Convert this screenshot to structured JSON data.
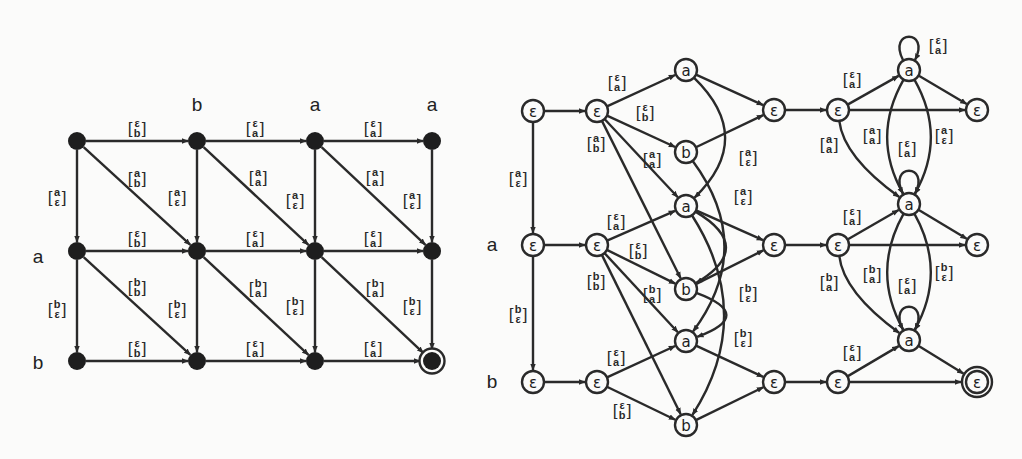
{
  "left_graph": {
    "column_labels": [
      {
        "text": "b",
        "x": 197,
        "y": 104
      },
      {
        "text": "a",
        "x": 315,
        "y": 104
      },
      {
        "text": "a",
        "x": 432,
        "y": 104
      }
    ],
    "row_labels": [
      {
        "text": "a",
        "x": 38,
        "y": 256
      },
      {
        "text": "b",
        "x": 38,
        "y": 362
      }
    ],
    "nodes": [
      {
        "id": "L00",
        "x": 77,
        "y": 141
      },
      {
        "id": "L01",
        "x": 197,
        "y": 141
      },
      {
        "id": "L02",
        "x": 315,
        "y": 141
      },
      {
        "id": "L03",
        "x": 432,
        "y": 141
      },
      {
        "id": "L10",
        "x": 77,
        "y": 251
      },
      {
        "id": "L11",
        "x": 197,
        "y": 251
      },
      {
        "id": "L12",
        "x": 315,
        "y": 251
      },
      {
        "id": "L13",
        "x": 432,
        "y": 251
      },
      {
        "id": "L20",
        "x": 77,
        "y": 361
      },
      {
        "id": "L21",
        "x": 197,
        "y": 361
      },
      {
        "id": "L22",
        "x": 315,
        "y": 361
      },
      {
        "id": "L23",
        "x": 432,
        "y": 361,
        "final": true
      }
    ],
    "edges": [
      {
        "from": "L00",
        "to": "L01",
        "top": "ε",
        "bottom": "b",
        "lx": 137,
        "ly": 128
      },
      {
        "from": "L01",
        "to": "L02",
        "top": "ε",
        "bottom": "a",
        "lx": 255,
        "ly": 128
      },
      {
        "from": "L02",
        "to": "L03",
        "top": "ε",
        "bottom": "a",
        "lx": 373,
        "ly": 128
      },
      {
        "from": "L10",
        "to": "L11",
        "top": "ε",
        "bottom": "b",
        "lx": 137,
        "ly": 238
      },
      {
        "from": "L11",
        "to": "L12",
        "top": "ε",
        "bottom": "a",
        "lx": 255,
        "ly": 238
      },
      {
        "from": "L12",
        "to": "L13",
        "top": "ε",
        "bottom": "a",
        "lx": 373,
        "ly": 238
      },
      {
        "from": "L20",
        "to": "L21",
        "top": "ε",
        "bottom": "b",
        "lx": 137,
        "ly": 348
      },
      {
        "from": "L21",
        "to": "L22",
        "top": "ε",
        "bottom": "a",
        "lx": 255,
        "ly": 348
      },
      {
        "from": "L22",
        "to": "L23",
        "top": "ε",
        "bottom": "a",
        "lx": 373,
        "ly": 348
      },
      {
        "from": "L00",
        "to": "L10",
        "top": "a",
        "bottom": "ε",
        "lx": 57,
        "ly": 197
      },
      {
        "from": "L01",
        "to": "L11",
        "top": "a",
        "bottom": "ε",
        "lx": 177,
        "ly": 197
      },
      {
        "from": "L02",
        "to": "L12",
        "top": "a",
        "bottom": "ε",
        "lx": 295,
        "ly": 200
      },
      {
        "from": "L03",
        "to": "L13",
        "top": "a",
        "bottom": "ε",
        "lx": 412,
        "ly": 200
      },
      {
        "from": "L10",
        "to": "L20",
        "top": "b",
        "bottom": "ε",
        "lx": 57,
        "ly": 309
      },
      {
        "from": "L11",
        "to": "L21",
        "top": "b",
        "bottom": "ε",
        "lx": 177,
        "ly": 309
      },
      {
        "from": "L12",
        "to": "L22",
        "top": "b",
        "bottom": "ε",
        "lx": 295,
        "ly": 306
      },
      {
        "from": "L13",
        "to": "L23",
        "top": "b",
        "bottom": "ε",
        "lx": 412,
        "ly": 306
      },
      {
        "from": "L00",
        "to": "L11",
        "top": "a",
        "bottom": "b",
        "lx": 137,
        "ly": 178
      },
      {
        "from": "L01",
        "to": "L12",
        "top": "a",
        "bottom": "a",
        "lx": 258,
        "ly": 177
      },
      {
        "from": "L02",
        "to": "L13",
        "top": "a",
        "bottom": "a",
        "lx": 375,
        "ly": 177
      },
      {
        "from": "L10",
        "to": "L21",
        "top": "b",
        "bottom": "b",
        "lx": 137,
        "ly": 287
      },
      {
        "from": "L11",
        "to": "L22",
        "top": "b",
        "bottom": "a",
        "lx": 258,
        "ly": 288
      },
      {
        "from": "L12",
        "to": "L23",
        "top": "b",
        "bottom": "a",
        "lx": 375,
        "ly": 288
      }
    ]
  },
  "right_graph": {
    "row_labels": [
      {
        "text": "a",
        "x": 492,
        "y": 244
      },
      {
        "text": "b",
        "x": 492,
        "y": 381
      }
    ],
    "nodes": [
      {
        "id": "R0",
        "x": 533,
        "y": 111,
        "sym": "ε"
      },
      {
        "id": "R1",
        "x": 597,
        "y": 111,
        "sym": "ε"
      },
      {
        "id": "R2",
        "x": 533,
        "y": 245,
        "sym": "ε"
      },
      {
        "id": "R3",
        "x": 597,
        "y": 245,
        "sym": "ε"
      },
      {
        "id": "R4",
        "x": 533,
        "y": 382,
        "sym": "ε"
      },
      {
        "id": "R5",
        "x": 597,
        "y": 382,
        "sym": "ε"
      },
      {
        "id": "M0",
        "x": 686,
        "y": 70,
        "sym": "a"
      },
      {
        "id": "M1",
        "x": 686,
        "y": 152,
        "sym": "b"
      },
      {
        "id": "M2",
        "x": 686,
        "y": 206,
        "sym": "a"
      },
      {
        "id": "M3",
        "x": 686,
        "y": 289,
        "sym": "b"
      },
      {
        "id": "M4",
        "x": 686,
        "y": 341,
        "sym": "a"
      },
      {
        "id": "M5",
        "x": 686,
        "y": 425,
        "sym": "b"
      },
      {
        "id": "E0",
        "x": 774,
        "y": 110,
        "sym": "ε"
      },
      {
        "id": "E1",
        "x": 774,
        "y": 245,
        "sym": "ε"
      },
      {
        "id": "E2",
        "x": 774,
        "y": 382,
        "sym": "ε"
      },
      {
        "id": "F0",
        "x": 838,
        "y": 110,
        "sym": "ε"
      },
      {
        "id": "F1",
        "x": 838,
        "y": 245,
        "sym": "ε"
      },
      {
        "id": "F2",
        "x": 838,
        "y": 382,
        "sym": "ε"
      },
      {
        "id": "A0",
        "x": 909,
        "y": 70,
        "sym": "a"
      },
      {
        "id": "A1",
        "x": 909,
        "y": 204,
        "sym": "a"
      },
      {
        "id": "A2",
        "x": 909,
        "y": 340,
        "sym": "a"
      },
      {
        "id": "G0",
        "x": 977,
        "y": 110,
        "sym": "ε"
      },
      {
        "id": "G1",
        "x": 977,
        "y": 245,
        "sym": "ε"
      },
      {
        "id": "G2",
        "x": 977,
        "y": 382,
        "sym": "ε",
        "final": true
      }
    ],
    "edges": [
      {
        "from": "R0",
        "to": "R1"
      },
      {
        "from": "R2",
        "to": "R3"
      },
      {
        "from": "R4",
        "to": "R5"
      },
      {
        "from": "R0",
        "to": "R2",
        "top": "a",
        "bottom": "ε",
        "lx": 518,
        "ly": 178
      },
      {
        "from": "R2",
        "to": "R4",
        "top": "b",
        "bottom": "ε",
        "lx": 518,
        "ly": 314
      },
      {
        "from": "R1",
        "to": "M0",
        "top": "ε",
        "bottom": "a",
        "lx": 617,
        "ly": 82
      },
      {
        "from": "R1",
        "to": "M1",
        "top": "ε",
        "bottom": "b",
        "lx": 645,
        "ly": 112
      },
      {
        "from": "R1",
        "to": "M2",
        "top": "a",
        "bottom": "a",
        "lx": 652,
        "ly": 159
      },
      {
        "from": "R1",
        "to": "M3",
        "top": "a",
        "bottom": "b",
        "lx": 596,
        "ly": 143
      },
      {
        "from": "R3",
        "to": "M2",
        "top": "ε",
        "bottom": "a",
        "lx": 616,
        "ly": 221
      },
      {
        "from": "R3",
        "to": "M3",
        "top": "ε",
        "bottom": "b",
        "lx": 638,
        "ly": 250
      },
      {
        "from": "R3",
        "to": "M4",
        "top": "b",
        "bottom": "a",
        "lx": 652,
        "ly": 294
      },
      {
        "from": "R3",
        "to": "M5",
        "top": "b",
        "bottom": "b",
        "lx": 596,
        "ly": 281
      },
      {
        "from": "R5",
        "to": "M4",
        "top": "ε",
        "bottom": "a",
        "lx": 616,
        "ly": 357
      },
      {
        "from": "R5",
        "to": "M5",
        "top": "ε",
        "bottom": "b",
        "lx": 622,
        "ly": 410
      },
      {
        "from": "M0",
        "to": "E0"
      },
      {
        "from": "M1",
        "to": "E0"
      },
      {
        "from": "M2",
        "to": "E1"
      },
      {
        "from": "M3",
        "to": "E1"
      },
      {
        "from": "M4",
        "to": "E2"
      },
      {
        "from": "M5",
        "to": "E2"
      },
      {
        "from": "M0",
        "to": "M2",
        "curve": true,
        "top": "a",
        "bottom": "ε",
        "lx": 748,
        "ly": 157
      },
      {
        "from": "M1",
        "to": "M4",
        "curve": true,
        "top": "a",
        "bottom": "ε",
        "lx": 743,
        "ly": 196
      },
      {
        "from": "M2",
        "to": "M3",
        "curve": true
      },
      {
        "from": "M3",
        "to": "M4",
        "curve": true,
        "top": "b",
        "bottom": "ε",
        "lx": 748,
        "ly": 293
      },
      {
        "from": "M2",
        "to": "M5",
        "curve": true,
        "top": "b",
        "bottom": "ε",
        "lx": 743,
        "ly": 338
      },
      {
        "from": "E0",
        "to": "F0"
      },
      {
        "from": "E1",
        "to": "F1"
      },
      {
        "from": "E2",
        "to": "F2"
      },
      {
        "from": "F0",
        "to": "A0",
        "top": "ε",
        "bottom": "a",
        "lx": 852,
        "ly": 79
      },
      {
        "from": "F0",
        "to": "G0"
      },
      {
        "from": "A0",
        "to": "G0"
      },
      {
        "from": "F1",
        "to": "A1",
        "top": "ε",
        "bottom": "a",
        "lx": 852,
        "ly": 216
      },
      {
        "from": "F1",
        "to": "G1"
      },
      {
        "from": "A1",
        "to": "G1"
      },
      {
        "from": "F2",
        "to": "A2",
        "top": "ε",
        "bottom": "a",
        "lx": 852,
        "ly": 352
      },
      {
        "from": "F2",
        "to": "G2"
      },
      {
        "from": "A2",
        "to": "G2"
      },
      {
        "from": "F0",
        "to": "A1",
        "curve": true,
        "top": "a",
        "bottom": "a",
        "lx": 829,
        "ly": 144
      },
      {
        "from": "A0",
        "to": "A1",
        "curve": true,
        "side": "left",
        "top": "a",
        "bottom": "a",
        "lx": 872,
        "ly": 135
      },
      {
        "from": "A0",
        "to": "A1",
        "curve": true,
        "side": "right",
        "top": "a",
        "bottom": "ε",
        "lx": 944,
        "ly": 135
      },
      {
        "from": "F1",
        "to": "A2",
        "curve": true,
        "top": "b",
        "bottom": "a",
        "lx": 829,
        "ly": 282
      },
      {
        "from": "A1",
        "to": "A2",
        "curve": true,
        "side": "left",
        "top": "b",
        "bottom": "a",
        "lx": 872,
        "ly": 274
      },
      {
        "from": "A1",
        "to": "A2",
        "curve": true,
        "side": "right",
        "top": "b",
        "bottom": "ε",
        "lx": 944,
        "ly": 272
      }
    ],
    "loops": [
      {
        "node": "A0",
        "top": "ε",
        "bottom": "a",
        "lx": 938,
        "ly": 45
      },
      {
        "node": "A1",
        "top": "ε",
        "bottom": "a",
        "lx": 907,
        "ly": 148
      },
      {
        "node": "A2",
        "top": "ε",
        "bottom": "a",
        "lx": 907,
        "ly": 285
      }
    ]
  }
}
